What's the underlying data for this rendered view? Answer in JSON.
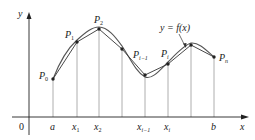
{
  "diagram": {
    "colors": {
      "axis": "#222222",
      "gridline": "#9a9a9a",
      "curve": "#555555",
      "polygon": "#333333",
      "point": "#222222"
    },
    "axes": {
      "x_label": "x",
      "y_label": "y",
      "origin_label": "0"
    },
    "x_ticks": [
      {
        "label": "a",
        "sub": "",
        "x": 53
      },
      {
        "label": "x",
        "sub": "1",
        "x": 77
      },
      {
        "label": "x",
        "sub": "2",
        "x": 99
      },
      {
        "label": "",
        "sub": "",
        "x": 122
      },
      {
        "label": "x",
        "sub": "i−1",
        "x": 145
      },
      {
        "label": "x",
        "sub": "i",
        "x": 168
      },
      {
        "label": "",
        "sub": "",
        "x": 191
      },
      {
        "label": "b",
        "sub": "",
        "x": 214
      }
    ],
    "points": [
      {
        "name": "P",
        "sub": "0",
        "x": 53,
        "y": 79
      },
      {
        "name": "P",
        "sub": "1",
        "x": 77,
        "y": 42
      },
      {
        "name": "P",
        "sub": "2",
        "x": 99,
        "y": 29
      },
      {
        "name": "",
        "sub": "",
        "x": 122,
        "y": 49
      },
      {
        "name": "P",
        "sub": "i−1",
        "x": 145,
        "y": 75
      },
      {
        "name": "P",
        "sub": "i",
        "x": 168,
        "y": 64
      },
      {
        "name": "",
        "sub": "",
        "x": 191,
        "y": 45
      },
      {
        "name": "P",
        "sub": "n",
        "x": 214,
        "y": 57
      }
    ],
    "curve_label": "y = f(x)",
    "labels": {
      "P0": "P",
      "P0_sub": "0",
      "P1": "P",
      "P1_sub": "1",
      "P2": "P",
      "P2_sub": "2",
      "Pim1": "P",
      "Pim1_sub": "i−1",
      "Pi": "P",
      "Pi_sub": "i",
      "Pn": "P",
      "Pn_sub": "n",
      "a": "a",
      "x1": "x",
      "x1_sub": "1",
      "x2": "x",
      "x2_sub": "2",
      "xim1": "x",
      "xim1_sub": "i−1",
      "xi": "x",
      "xi_sub": "i",
      "b": "b"
    }
  }
}
